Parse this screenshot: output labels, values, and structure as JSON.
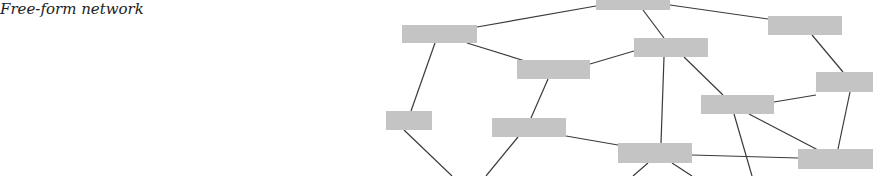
{
  "title": "Free-form network",
  "colors": {
    "node": "#c4c4c4",
    "edge": "#3a3a3a",
    "background": "#ffffff"
  },
  "nodes": [
    {
      "id": "n1",
      "x": 596,
      "y": -8,
      "w": 74,
      "h": 18
    },
    {
      "id": "n2",
      "x": 402,
      "y": 25,
      "w": 75,
      "h": 18
    },
    {
      "id": "n3",
      "x": 517,
      "y": 60,
      "w": 73,
      "h": 19
    },
    {
      "id": "n4",
      "x": 634,
      "y": 38,
      "w": 74,
      "h": 19
    },
    {
      "id": "n5",
      "x": 768,
      "y": 16,
      "w": 74,
      "h": 19
    },
    {
      "id": "n6",
      "x": 816,
      "y": 72,
      "w": 57,
      "h": 20
    },
    {
      "id": "n7",
      "x": 701,
      "y": 95,
      "w": 73,
      "h": 19
    },
    {
      "id": "n8",
      "x": 386,
      "y": 111,
      "w": 46,
      "h": 19
    },
    {
      "id": "n9",
      "x": 492,
      "y": 118,
      "w": 74,
      "h": 19
    },
    {
      "id": "n10",
      "x": 618,
      "y": 143,
      "w": 74,
      "h": 20
    },
    {
      "id": "n11",
      "x": 798,
      "y": 149,
      "w": 75,
      "h": 20
    }
  ],
  "edges": [
    {
      "x1": 477,
      "y1": 27,
      "x2": 596,
      "y2": 6
    },
    {
      "x1": 670,
      "y1": 5,
      "x2": 768,
      "y2": 19
    },
    {
      "x1": 643,
      "y1": 10,
      "x2": 664,
      "y2": 38
    },
    {
      "x1": 467,
      "y1": 43,
      "x2": 525,
      "y2": 61
    },
    {
      "x1": 590,
      "y1": 64,
      "x2": 634,
      "y2": 51
    },
    {
      "x1": 435,
      "y1": 43,
      "x2": 411,
      "y2": 111
    },
    {
      "x1": 548,
      "y1": 79,
      "x2": 531,
      "y2": 118
    },
    {
      "x1": 664,
      "y1": 57,
      "x2": 661,
      "y2": 143
    },
    {
      "x1": 684,
      "y1": 57,
      "x2": 723,
      "y2": 95
    },
    {
      "x1": 812,
      "y1": 35,
      "x2": 843,
      "y2": 72
    },
    {
      "x1": 774,
      "y1": 102,
      "x2": 816,
      "y2": 95
    },
    {
      "x1": 850,
      "y1": 92,
      "x2": 838,
      "y2": 149
    },
    {
      "x1": 749,
      "y1": 114,
      "x2": 818,
      "y2": 150
    },
    {
      "x1": 734,
      "y1": 114,
      "x2": 752,
      "y2": 176
    },
    {
      "x1": 566,
      "y1": 136,
      "x2": 618,
      "y2": 145
    },
    {
      "x1": 692,
      "y1": 155,
      "x2": 798,
      "y2": 158
    },
    {
      "x1": 404,
      "y1": 130,
      "x2": 452,
      "y2": 176
    },
    {
      "x1": 518,
      "y1": 137,
      "x2": 486,
      "y2": 176
    },
    {
      "x1": 648,
      "y1": 163,
      "x2": 633,
      "y2": 176
    },
    {
      "x1": 672,
      "y1": 163,
      "x2": 692,
      "y2": 176
    }
  ]
}
